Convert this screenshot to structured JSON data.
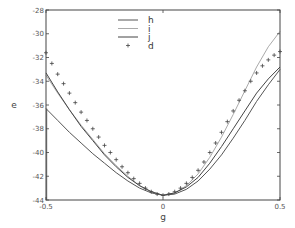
{
  "chart_data": {
    "type": "line",
    "title": "",
    "xlabel": "g",
    "ylabel": "e",
    "xlim": [
      -0.5,
      0.5
    ],
    "ylim": [
      -44,
      -28
    ],
    "xticks": [
      "-0.5",
      "0",
      "0.5"
    ],
    "yticks": [
      "-28",
      "-30",
      "-32",
      "-34",
      "-36",
      "-38",
      "-40",
      "-42",
      "-44"
    ],
    "xtick_values": [
      -0.5,
      0,
      0.5
    ],
    "ytick_values": [
      -28,
      -30,
      -32,
      -34,
      -36,
      -38,
      -40,
      -42,
      -44
    ],
    "grid": false,
    "legend_position": "top-center",
    "series": [
      {
        "name": "h",
        "style": "line",
        "color": "#555555",
        "x": [
          -0.5,
          -0.45,
          -0.4,
          -0.35,
          -0.3,
          -0.25,
          -0.2,
          -0.15,
          -0.1,
          -0.05,
          0,
          0.05,
          0.1,
          0.15,
          0.2,
          0.25,
          0.3,
          0.35,
          0.4,
          0.45,
          0.5
        ],
        "y": [
          -36.3,
          -37.3,
          -38.3,
          -39.2,
          -40.1,
          -40.9,
          -41.7,
          -42.4,
          -43.0,
          -43.4,
          -43.6,
          -43.5,
          -43.1,
          -42.4,
          -41.4,
          -40.2,
          -38.8,
          -37.3,
          -35.7,
          -34.3,
          -33.0
        ]
      },
      {
        "name": "i",
        "style": "line",
        "color": "#aaaaaa",
        "x": [
          -0.5,
          -0.45,
          -0.4,
          -0.35,
          -0.3,
          -0.25,
          -0.2,
          -0.15,
          -0.1,
          -0.05,
          0,
          0.05,
          0.1,
          0.15,
          0.2,
          0.25,
          0.3,
          0.35,
          0.4,
          0.45,
          0.5
        ],
        "y": [
          -33.5,
          -35.0,
          -36.4,
          -37.7,
          -38.9,
          -40.1,
          -41.1,
          -42.0,
          -42.8,
          -43.3,
          -43.6,
          -43.4,
          -42.8,
          -41.8,
          -40.4,
          -38.7,
          -36.8,
          -34.8,
          -32.8,
          -31.1,
          -29.8
        ]
      },
      {
        "name": "j",
        "style": "line",
        "color": "#444444",
        "x": [
          -0.5,
          -0.45,
          -0.4,
          -0.35,
          -0.3,
          -0.25,
          -0.2,
          -0.15,
          -0.1,
          -0.05,
          0,
          0.05,
          0.1,
          0.15,
          0.2,
          0.25,
          0.3,
          0.35,
          0.4,
          0.45,
          0.5
        ],
        "y": [
          -33.3,
          -34.9,
          -36.4,
          -37.8,
          -39.0,
          -40.2,
          -41.2,
          -42.1,
          -42.8,
          -43.3,
          -43.6,
          -43.4,
          -42.9,
          -42.1,
          -40.9,
          -39.5,
          -38.0,
          -36.5,
          -35.0,
          -33.8,
          -32.8
        ]
      },
      {
        "name": "d",
        "style": "marker",
        "color": "#444444",
        "x": [
          -0.5,
          -0.475,
          -0.45,
          -0.425,
          -0.4,
          -0.375,
          -0.35,
          -0.325,
          -0.3,
          -0.275,
          -0.25,
          -0.225,
          -0.2,
          -0.175,
          -0.15,
          -0.125,
          -0.1,
          -0.075,
          -0.05,
          -0.025,
          0,
          0.025,
          0.05,
          0.075,
          0.1,
          0.125,
          0.15,
          0.175,
          0.2,
          0.225,
          0.25,
          0.275,
          0.3,
          0.325,
          0.35,
          0.375,
          0.4,
          0.425,
          0.45,
          0.475,
          0.5
        ],
        "y": [
          -31.6,
          -32.5,
          -33.4,
          -34.2,
          -35.0,
          -35.8,
          -36.6,
          -37.3,
          -38.0,
          -38.7,
          -39.4,
          -40.0,
          -40.6,
          -41.2,
          -41.7,
          -42.2,
          -42.6,
          -43.0,
          -43.3,
          -43.5,
          -43.6,
          -43.5,
          -43.3,
          -43.0,
          -42.6,
          -42.1,
          -41.5,
          -40.8,
          -40.0,
          -39.2,
          -38.3,
          -37.4,
          -36.5,
          -35.6,
          -34.8,
          -34.0,
          -33.3,
          -32.7,
          -32.2,
          -31.8,
          -31.5
        ]
      }
    ]
  }
}
